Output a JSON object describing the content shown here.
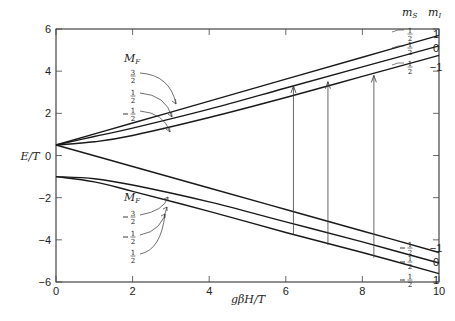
{
  "chart_data": {
    "type": "line",
    "title": "",
    "xlabel": "gβH/T",
    "ylabel": "E/T",
    "xlim": [
      0,
      10
    ],
    "ylim": [
      -6,
      6
    ],
    "xticks": [
      0,
      2,
      4,
      6,
      8,
      10
    ],
    "yticks": [
      -6,
      -4,
      -2,
      0,
      2,
      4,
      6
    ],
    "xtick_labels": [
      "0",
      "2",
      "4",
      "6",
      "8",
      "10"
    ],
    "ytick_labels": [
      "−6",
      "−4",
      "−2",
      "0",
      "2",
      "4",
      "6"
    ],
    "grid": false,
    "series": [
      {
        "name": "upper M_F=3/2 (m_s=1/2, m_I=1)",
        "x": [
          0,
          2,
          4,
          6,
          8,
          10
        ],
        "y": [
          0.5,
          1.54,
          2.58,
          3.62,
          4.66,
          5.7
        ]
      },
      {
        "name": "upper M_F=1/2 (m_s=1/2, m_I=0)",
        "x": [
          0,
          1,
          2,
          4,
          6,
          8,
          10
        ],
        "y": [
          0.5,
          0.9,
          1.3,
          2.2,
          3.2,
          4.2,
          5.2
        ]
      },
      {
        "name": "upper M_F=-1/2 (m_s=1/2, m_I=-1)",
        "x": [
          0,
          1,
          2,
          4,
          6,
          8,
          10
        ],
        "y": [
          0.5,
          0.65,
          0.95,
          1.8,
          2.75,
          3.75,
          4.75
        ]
      },
      {
        "name": "lower M_F=-3/2 (m_s=-1/2, m_I=-1)",
        "x": [
          0,
          2,
          4,
          6,
          8,
          10
        ],
        "y": [
          0.5,
          -0.52,
          -1.54,
          -2.56,
          -3.58,
          -4.6
        ]
      },
      {
        "name": "lower M_F=-1/2 (m_s=-1/2, m_I=0)",
        "x": [
          0,
          1,
          2,
          4,
          6,
          8,
          10
        ],
        "y": [
          -1.0,
          -1.1,
          -1.4,
          -2.2,
          -3.15,
          -4.1,
          -5.1
        ]
      },
      {
        "name": "lower M_F=1/2 (m_s=-1/2, m_I=1)",
        "x": [
          0,
          1,
          2,
          4,
          6,
          8,
          10
        ],
        "y": [
          -1.0,
          -1.25,
          -1.7,
          -2.65,
          -3.65,
          -4.6,
          -5.6
        ]
      }
    ],
    "transitions": [
      {
        "x": 6.2,
        "from": -3.75,
        "to": 3.3
      },
      {
        "x": 7.1,
        "from": -4.25,
        "to": 3.5
      },
      {
        "x": 8.3,
        "from": -4.85,
        "to": 3.8
      }
    ],
    "annotations": {
      "upper_group_label": "M_F",
      "upper_mf": [
        "3/2",
        "1/2",
        "−1/2"
      ],
      "lower_group_label": "M_F",
      "lower_mf": [
        "−3/2",
        "−1/2",
        "1/2"
      ],
      "right_header_ms": "m_S",
      "right_header_mi": "m_I",
      "right_upper": [
        {
          "ms": "1/2",
          "mi": "1"
        },
        {
          "ms": "1/2",
          "mi": "0"
        },
        {
          "ms": "1/2",
          "mi": "−1"
        }
      ],
      "right_lower": [
        {
          "ms": "−1/2",
          "mi": "−1"
        },
        {
          "ms": "−1/2",
          "mi": "0"
        },
        {
          "ms": "−1/2",
          "mi": "1"
        }
      ]
    }
  },
  "labels": {
    "xlabel": "gβH/T",
    "ylabel": "E/T",
    "mf": "M",
    "mf_sub": "F",
    "ms": "m",
    "ms_sub": "S",
    "mi": "m",
    "mi_sub": "I"
  }
}
